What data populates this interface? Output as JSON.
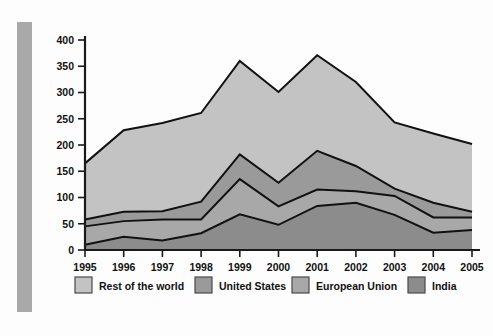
{
  "chart_data": {
    "type": "area",
    "stacked": true,
    "title": "",
    "subtitle": "",
    "xlabel": "",
    "ylabel": "",
    "categories": [
      "1995",
      "1996",
      "1997",
      "1998",
      "1999",
      "2000",
      "2001",
      "2002",
      "2003",
      "2004",
      "2005"
    ],
    "x": [
      1995,
      1996,
      1997,
      1998,
      1999,
      2000,
      2001,
      2002,
      2003,
      2004,
      2005
    ],
    "ylim": [
      0,
      400
    ],
    "yticks": [
      0,
      50,
      100,
      150,
      200,
      250,
      300,
      350,
      400
    ],
    "ytick_labels": [
      "0",
      "50",
      "100",
      "150",
      "200",
      "250",
      "300",
      "350",
      "400"
    ],
    "grid": false,
    "legend_position": "bottom",
    "stack_order_bottom_to_top": [
      "India",
      "European Union",
      "United States",
      "Rest of the world"
    ],
    "series": [
      {
        "name": "Rest of the world",
        "color": "#c3c3c3",
        "values": [
          107,
          155,
          168,
          169,
          178,
          173,
          182,
          160,
          126,
          132,
          129
        ]
      },
      {
        "name": "United States",
        "color": "#9a9a9a",
        "values": [
          13,
          18,
          16,
          34,
          47,
          45,
          74,
          48,
          14,
          28,
          11
        ]
      },
      {
        "name": "European Union",
        "color": "#a8a8a8",
        "values": [
          35,
          30,
          40,
          26,
          67,
          35,
          31,
          22,
          36,
          29,
          24
        ]
      },
      {
        "name": "India",
        "color": "#8c8c8c",
        "values": [
          10,
          25,
          18,
          32,
          68,
          48,
          84,
          90,
          67,
          33,
          38
        ]
      }
    ],
    "cumulative_boundaries": {
      "india": [
        10,
        25,
        18,
        32,
        68,
        48,
        84,
        90,
        67,
        33,
        38
      ],
      "india_plus_eu": [
        45,
        55,
        58,
        58,
        135,
        83,
        115,
        112,
        103,
        62,
        62
      ],
      "india_plus_eu_plus_us": [
        58,
        73,
        74,
        92,
        182,
        128,
        189,
        160,
        117,
        90,
        73
      ],
      "total": [
        165,
        228,
        242,
        261,
        360,
        301,
        371,
        320,
        243,
        222,
        202
      ]
    },
    "totals": [
      165,
      228,
      242,
      261,
      360,
      301,
      371,
      320,
      243,
      222,
      202
    ]
  },
  "legend": {
    "items": [
      {
        "label": "Rest of the world",
        "color": "#c3c3c3"
      },
      {
        "label": "United States",
        "color": "#9a9a9a"
      },
      {
        "label": "European Union",
        "color": "#a8a8a8"
      },
      {
        "label": "India",
        "color": "#8c8c8c"
      }
    ]
  },
  "colors": {
    "rest_of_world": "#c3c3c3",
    "united_states": "#9a9a9a",
    "european_union": "#a8a8a8",
    "india": "#8c8c8c",
    "axis": "#1a1a1a",
    "background": "#fdfdfd",
    "side_bar": "#a9a9a9"
  }
}
